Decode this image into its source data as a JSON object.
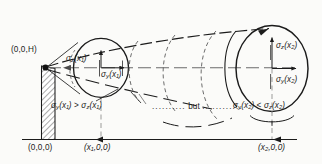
{
  "figure": {
    "type": "plume-dispersion-cross-section-diagram",
    "background_color": "#fbfbf9",
    "ink_color": "#1b1b1b",
    "source_point_label": "(0,0,H)",
    "origin_label": "(0,0,0)",
    "station1_label": "(x₁,0,0)",
    "station2_label": "(x₂,0,0)",
    "connector_text": "but",
    "connector_leader_left": "..........",
    "connector_leader_right": "............",
    "cross_section_1": {
      "vertical_sigma_label": "σ_z(x₁)",
      "vertical_sigma_text": "σ",
      "vertical_sigma_sub": "z",
      "vertical_sigma_arg": "(x₁)",
      "horizontal_sigma_text": "σ",
      "horizontal_sigma_sub": "y",
      "horizontal_sigma_arg": "(x₁)",
      "inequality": "σ_y(x₁) > σ_z(x₁)",
      "inequality_parts": {
        "left_sigma": "σ",
        "left_sub": "y",
        "left_arg": "(x₁)",
        "operator": ">",
        "right_sigma": "σ",
        "right_sub": "z",
        "right_arg": "(x₁)"
      }
    },
    "cross_section_2": {
      "vertical_sigma_text": "σ",
      "vertical_sigma_sub": "z",
      "vertical_sigma_arg": "(x₂)",
      "horizontal_sigma_text": "σ",
      "horizontal_sigma_sub": "y",
      "horizontal_sigma_arg": "(x₂)",
      "inequality": "σ_y(x₂) < σ_z(x₂)",
      "inequality_parts": {
        "left_sigma": "σ",
        "left_sub": "y",
        "left_arg": "(x₂)",
        "operator": "<",
        "right_sigma": "σ",
        "right_sub": "z",
        "right_arg": "(x₂)"
      }
    },
    "axis": {
      "ground_line": true,
      "x_axis_arrowheads": 2
    },
    "stack": {
      "hatched": true,
      "description": "hatched chimney stack"
    }
  }
}
